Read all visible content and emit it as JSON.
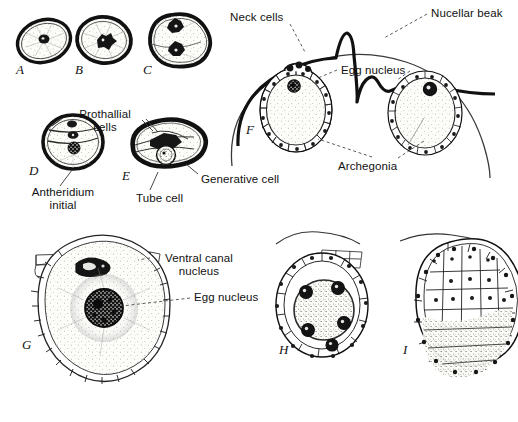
{
  "figure": {
    "title_fragment": "",
    "panel_letters": [
      {
        "id": "A",
        "text": "A",
        "x": 16,
        "y": 62
      },
      {
        "id": "B",
        "text": "B",
        "x": 75,
        "y": 62
      },
      {
        "id": "C",
        "text": "C",
        "x": 143,
        "y": 62
      },
      {
        "id": "D",
        "text": "D",
        "x": 29,
        "y": 163
      },
      {
        "id": "E",
        "text": "E",
        "x": 122,
        "y": 168
      },
      {
        "id": "F",
        "text": "F",
        "x": 246,
        "y": 122
      },
      {
        "id": "G",
        "text": "G",
        "x": 22,
        "y": 337
      },
      {
        "id": "H",
        "text": "H",
        "x": 279,
        "y": 342
      },
      {
        "id": "I",
        "text": "I",
        "x": 403,
        "y": 342
      }
    ],
    "labels": [
      {
        "name": "prothallial-cells",
        "text": "Prothallial\ncells",
        "x": 66,
        "y": 110,
        "align": "center",
        "w": 78
      },
      {
        "name": "antheridium-initial",
        "text": "Antheridium\ninitial",
        "x": 20,
        "y": 188,
        "align": "center",
        "w": 88
      },
      {
        "name": "tube-cell",
        "text": "Tube cell",
        "x": 135,
        "y": 194,
        "align": "left",
        "w": 60
      },
      {
        "name": "generative-cell",
        "text": "Generative cell",
        "x": 200,
        "y": 176,
        "align": "left",
        "w": 92
      },
      {
        "name": "neck-cells",
        "text": "Neck cells",
        "x": 229,
        "y": 13,
        "align": "left",
        "w": 64
      },
      {
        "name": "nucellar-beak",
        "text": "Nucellar beak",
        "x": 430,
        "y": 9,
        "align": "left",
        "w": 84
      },
      {
        "name": "egg-nucleus-f",
        "text": "Egg nucleus",
        "x": 340,
        "y": 64,
        "align": "left",
        "w": 74
      },
      {
        "name": "archegonia",
        "text": "Archegonia",
        "x": 337,
        "y": 161,
        "align": "left",
        "w": 70
      },
      {
        "name": "ventral-canal-nucleus",
        "text": "Ventral canal\nnucleus",
        "x": 155,
        "y": 254,
        "align": "center",
        "w": 86
      },
      {
        "name": "egg-nucleus-g",
        "text": "Egg nucleus",
        "x": 193,
        "y": 293,
        "align": "left",
        "w": 74
      }
    ],
    "colors": {
      "ink": "#111111",
      "background": "#ffffff",
      "nucleus_fill": "#1a1a1a",
      "cytoplasm_fill": "#fbfbf7",
      "wall_stroke": "#151515"
    },
    "caption_note": "Stages of pollen grain development (A-E) and archegonium / egg development (F-I)"
  }
}
